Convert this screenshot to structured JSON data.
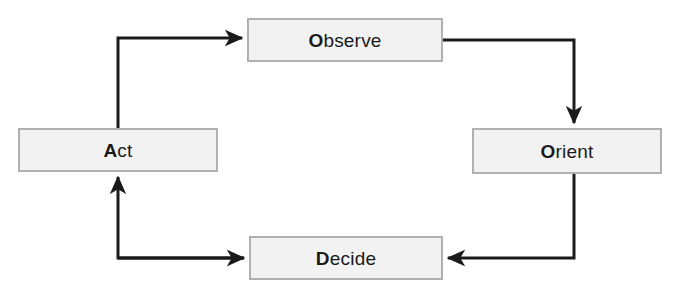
{
  "diagram": {
    "type": "flow-cycle",
    "background_color": "#ffffff",
    "node_fill_color": "#f2f2f2",
    "node_border_color": "#b0b0b0",
    "connector_color": "#1a1a1a",
    "text_color": "#1a1a1a",
    "nodes": [
      {
        "id": "observe",
        "label": "Observe",
        "lead": "O",
        "rest": "bserve",
        "x": 247,
        "y": 18,
        "width": 196,
        "height": 44
      },
      {
        "id": "orient",
        "label": "Orient",
        "lead": "O",
        "rest": "rient",
        "x": 472,
        "y": 128,
        "width": 190,
        "height": 46
      },
      {
        "id": "decide",
        "label": "Decide",
        "lead": "D",
        "rest": "ecide",
        "x": 249,
        "y": 236,
        "width": 194,
        "height": 44
      },
      {
        "id": "act",
        "label": "Act",
        "lead": "A",
        "rest": "ct",
        "x": 18,
        "y": 128,
        "width": 200,
        "height": 44
      }
    ],
    "connectors": [
      {
        "id": "act-to-observe",
        "from": "act",
        "to": "observe",
        "from_side": "top",
        "to_side": "left",
        "arrowhead": "right"
      },
      {
        "id": "observe-to-orient",
        "from": "observe",
        "to": "orient",
        "from_side": "right",
        "to_side": "top",
        "arrowhead": "down"
      },
      {
        "id": "orient-to-decide",
        "from": "orient",
        "to": "decide",
        "from_side": "bottom",
        "to_side": "right",
        "arrowhead": "left"
      },
      {
        "id": "decide-to-act",
        "from": "decide",
        "to": "act",
        "from_side": "left",
        "to_side": "bottom",
        "arrowhead": "up"
      }
    ]
  }
}
